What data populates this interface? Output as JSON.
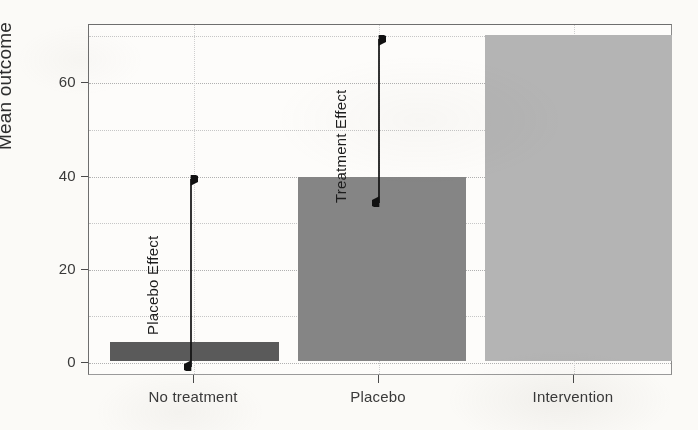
{
  "chart_data": {
    "type": "bar",
    "title": "",
    "xlabel": "",
    "ylabel": "Mean outcome",
    "categories": [
      "No treatment",
      "Placebo",
      "Intervention"
    ],
    "values": [
      4,
      39.5,
      70
    ],
    "series": [
      {
        "name": "Mean outcome",
        "values": [
          4,
          39.5,
          70
        ]
      }
    ],
    "ylim": [
      0,
      72
    ],
    "yticks": [
      0,
      20,
      40,
      60
    ],
    "ytick_labels": [
      "0",
      "20",
      "40",
      "60"
    ],
    "gridlines_y": [
      0,
      10,
      20,
      30,
      40,
      50,
      60,
      70
    ],
    "grid": true,
    "grid_style": "dotted",
    "legend": "none",
    "bar_colors": [
      "#5a5a5a",
      "#858585",
      "#b4b4b4"
    ],
    "annotations": [
      {
        "label": "Placebo Effect",
        "from_value": 4,
        "to_value": 39.5,
        "category_gap": "No treatment to Placebo",
        "style": "double-headed-vertical-arrow"
      },
      {
        "label": "Treatment Effect",
        "from_value": 39.5,
        "to_value": 70,
        "category_gap": "Placebo to Intervention",
        "style": "double-headed-vertical-arrow"
      }
    ]
  },
  "axis": {
    "y_title": "Mean outcome",
    "y_ticks": [
      {
        "label": "60",
        "value": 60
      },
      {
        "label": "40",
        "value": 40
      },
      {
        "label": "20",
        "value": 20
      },
      {
        "label": "0",
        "value": 0
      }
    ],
    "x_ticks": [
      {
        "label": "No treatment"
      },
      {
        "label": "Placebo"
      },
      {
        "label": "Intervention"
      }
    ]
  },
  "annotations": {
    "placebo_effect": "Placebo Effect",
    "treatment_effect": "Treatment Effect"
  },
  "colors": {
    "bar_no_treatment": "#5a5a5a",
    "bar_placebo": "#858585",
    "bar_intervention": "#b4b4b4",
    "axis": "#4a4a4a",
    "grid": "#c6c6c6",
    "text": "#2e2e2e",
    "background": "#fbfaf7"
  }
}
